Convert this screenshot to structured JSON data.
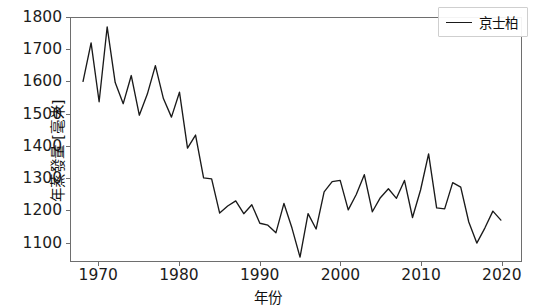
{
  "chart_data": {
    "type": "line",
    "title": "",
    "xlabel": "年份",
    "ylabel": "年蒸發量 [毫米]",
    "xlim": [
      1966.5,
      2022.5
    ],
    "ylim": [
      1040,
      1800
    ],
    "grid": false,
    "legend_position": "upper right",
    "xticks": [
      1970,
      1980,
      1990,
      2000,
      2010,
      2020
    ],
    "yticks": [
      1100,
      1200,
      1300,
      1400,
      1500,
      1600,
      1700,
      1800
    ],
    "series": [
      {
        "name": "京士柏",
        "color": "#1a1a1a",
        "x": [
          1968,
          1969,
          1970,
          1971,
          1972,
          1973,
          1974,
          1975,
          1976,
          1977,
          1978,
          1979,
          1980,
          1981,
          1982,
          1983,
          1984,
          1985,
          1986,
          1987,
          1988,
          1989,
          1990,
          1991,
          1992,
          1993,
          1994,
          1995,
          1996,
          1997,
          1998,
          1999,
          2000,
          2001,
          2002,
          2003,
          2004,
          2005,
          2006,
          2007,
          2008,
          2009,
          2010,
          2011,
          2012,
          2013,
          2014,
          2015,
          2016,
          2017,
          2018,
          2019,
          2020
        ],
        "values": [
          1602,
          1722,
          1538,
          1772,
          1598,
          1532,
          1620,
          1496,
          1562,
          1651,
          1548,
          1490,
          1568,
          1393,
          1434,
          1300,
          1297,
          1190,
          1212,
          1228,
          1188,
          1216,
          1158,
          1152,
          1128,
          1220,
          1143,
          1052,
          1188,
          1140,
          1256,
          1288,
          1292,
          1200,
          1248,
          1310,
          1194,
          1238,
          1266,
          1236,
          1292,
          1176,
          1262,
          1375,
          1206,
          1203,
          1285,
          1271,
          1162,
          1096,
          1143,
          1196,
          1168
        ]
      }
    ]
  },
  "legend": {
    "label": "京士柏"
  },
  "axes": {
    "ylabel": "年蒸發量 [毫米]",
    "xlabel": "年份",
    "ytick_labels": [
      "1800",
      "1700",
      "1600",
      "1500",
      "1400",
      "1300",
      "1200",
      "1100"
    ],
    "xtick_labels": [
      "1970",
      "1980",
      "1990",
      "2000",
      "2010",
      "2020"
    ]
  }
}
